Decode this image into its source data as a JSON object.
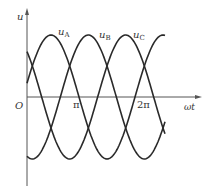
{
  "chart_data": {
    "type": "line",
    "title": "",
    "xlabel": "ωt",
    "ylabel": "u",
    "origin_label": "O",
    "x_ticks": [
      "π",
      "2π"
    ],
    "grid": false,
    "legend": "inline labels near peaks",
    "series": [
      {
        "name": "uA",
        "base": "u",
        "sub": "A",
        "phase_deg": 0,
        "amplitude": 1
      },
      {
        "name": "uB",
        "base": "u",
        "sub": "B",
        "phase_deg": -120,
        "amplitude": 1
      },
      {
        "name": "uC",
        "base": "u",
        "sub": "C",
        "phase_deg": 120,
        "amplitude": 1
      }
    ],
    "x_range_rad": [
      0,
      7.7
    ],
    "ylim": [
      -1.1,
      1.1
    ]
  },
  "labels": {
    "y_axis": "u",
    "x_axis": "ωt",
    "origin": "O",
    "pi": "π",
    "two_pi": "2π",
    "uA_base": "u",
    "uA_sub": "A",
    "uB_base": "u",
    "uB_sub": "B",
    "uC_base": "u",
    "uC_sub": "C"
  },
  "colors": {
    "line": "#2a2a2a",
    "axis": "#555555"
  }
}
